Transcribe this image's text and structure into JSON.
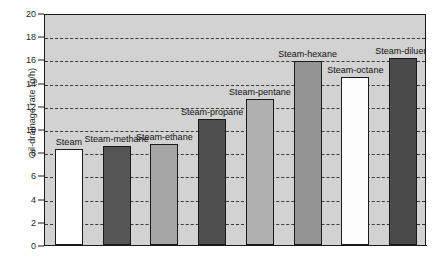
{
  "chart_data": {
    "type": "bar",
    "title": "",
    "xlabel": "",
    "ylabel": "Oil-drainage rate (g/h)",
    "ylim": [
      0,
      20
    ],
    "ytick_step": 2,
    "yticks": [
      0,
      2,
      4,
      6,
      8,
      10,
      12,
      14,
      16,
      18,
      20
    ],
    "ytick_labels": [
      "0",
      "2",
      "4",
      "6",
      "8",
      "10",
      "12",
      "14",
      "16",
      "18",
      "20"
    ],
    "grid": "horizontal-dashed",
    "legend": "none",
    "xtick_labels": [],
    "categories": [
      "Steam",
      "Steam-methane",
      "Steam-ethane",
      "Steam-propane",
      "Steam-pentane",
      "Steam-hexane",
      "Steam-octane",
      "Steam-diluent"
    ],
    "values": [
      8.3,
      8.5,
      8.7,
      10.9,
      12.6,
      15.9,
      14.5,
      16.1
    ],
    "bar_colors": [
      "#ffffff",
      "#555555",
      "#a6a6a6",
      "#4f4f4f",
      "#b0b0b0",
      "#949494",
      "#fdfdfd",
      "#4a4a4a"
    ],
    "bar_edge_color": "#1a1a1a",
    "plot_background": "#d2d2d2",
    "gridline_color": "#3a3a3a",
    "figure_background": "#ffffff",
    "annotations": [
      {
        "label": "Steam",
        "value": 8.3
      },
      {
        "label": "Steam-methane",
        "value": 8.5
      },
      {
        "label": "Steam-ethane",
        "value": 8.7
      },
      {
        "label": "Steam-propane",
        "value": 10.9
      },
      {
        "label": "Steam-pentane",
        "value": 12.6
      },
      {
        "label": "Steam-hexane",
        "value": 15.9
      },
      {
        "label": "Steam-octane",
        "value": 14.5
      },
      {
        "label": "Steam-diluent",
        "value": 16.1
      }
    ]
  }
}
